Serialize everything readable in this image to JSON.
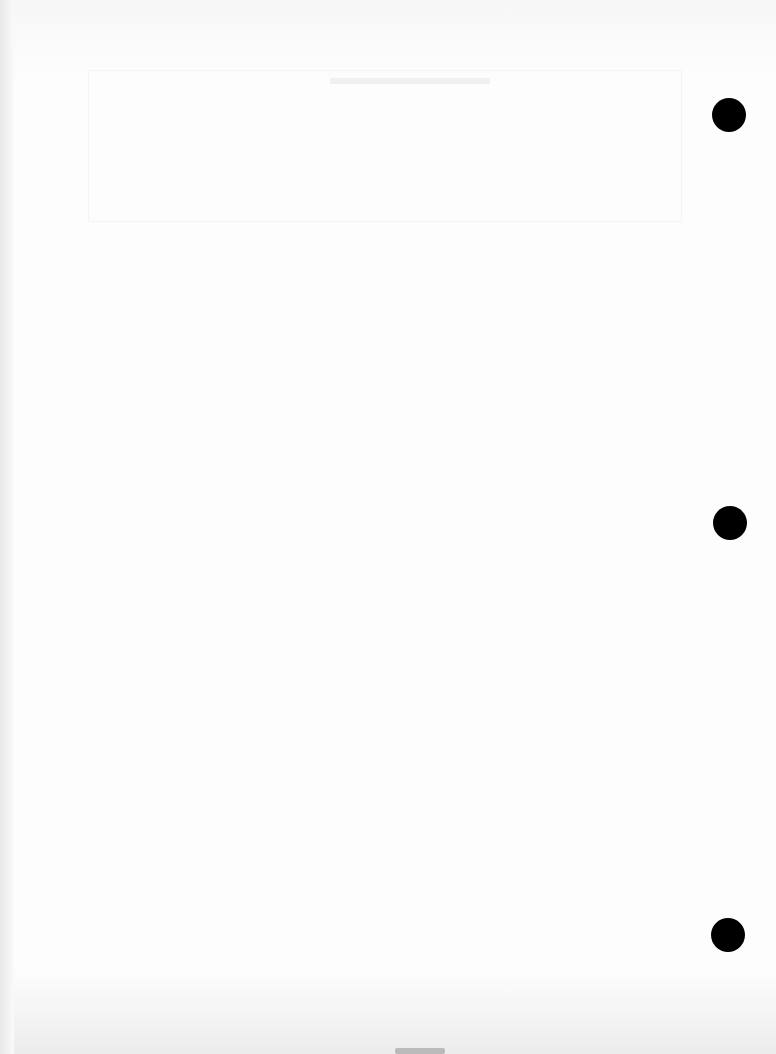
{
  "page": {
    "type": "blank scanned page",
    "background": "#fbfbfb",
    "punch_holes": [
      {
        "x": 712,
        "y": 98
      },
      {
        "x": 713,
        "y": 506
      },
      {
        "x": 711,
        "y": 918
      }
    ],
    "hole_color": "#000000"
  }
}
